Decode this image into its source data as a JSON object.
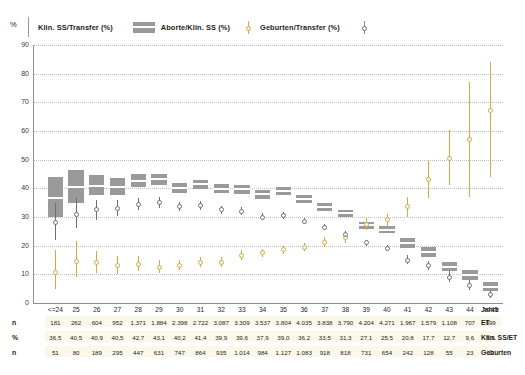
{
  "axis_corner_label": "%",
  "legend": {
    "items": [
      {
        "name": "klin-ss-transfer",
        "label": "Klin. SS/Transfer (%)",
        "marker": "vertical-rule",
        "color": "#999999"
      },
      {
        "name": "aborte-klin-ss",
        "label": "Aborte/Klin. SS (%)",
        "marker": "gray-box",
        "color": "#9a9a9a"
      },
      {
        "name": "geburten-transfer",
        "label": "Geburten/Transfer (%)",
        "marker": "orange-point",
        "color": "#e0a63c"
      },
      {
        "name": "gray-point-series",
        "label": "",
        "marker": "gray-point",
        "color": "#6f6f6f"
      }
    ]
  },
  "table": {
    "row_labels": [
      "n",
      "%",
      "n"
    ],
    "row_names": [
      "Jahre",
      "ET",
      "Klin. SS/ET",
      "Geburten"
    ],
    "et": [
      "181",
      "262",
      "604",
      "952",
      "1.371",
      "1.884",
      "2.398",
      "2.722",
      "3.087",
      "3.309",
      "3.537",
      "3.804",
      "4.035",
      "3.838",
      "3.790",
      "4.204",
      "4.271",
      "1.967",
      "1.579",
      "1.108",
      "707",
      "699"
    ],
    "klin_ss_et": [
      "36,5",
      "40,5",
      "40,9",
      "40,5",
      "42,7",
      "43,1",
      "40,2",
      "41,4",
      "39,9",
      "39,6",
      "37,9",
      "39,0",
      "36,2",
      "33,5",
      "31,3",
      "27,1",
      "25,5",
      "20,8",
      "17,7",
      "12,7",
      "9,6",
      "5,6"
    ],
    "geburten": [
      "51",
      "80",
      "189",
      "295",
      "447",
      "631",
      "747",
      "864",
      "935",
      "1.014",
      "984",
      "1.127",
      "1.083",
      "918",
      "818",
      "731",
      "654",
      "242",
      "128",
      "55",
      "23",
      "12"
    ]
  },
  "chart_data": {
    "type": "scatter",
    "title": "",
    "xlabel": "Jahre",
    "ylabel": "%",
    "ylim": [
      0,
      90
    ],
    "yticks": [
      0,
      10,
      20,
      30,
      40,
      50,
      60,
      70,
      80,
      90
    ],
    "grid": true,
    "legend_position": "top",
    "categories": [
      "<=24",
      "25",
      "26",
      "27",
      "28",
      "29",
      "30",
      "31",
      "32",
      "33",
      "34",
      "35",
      "36",
      "37",
      "38",
      "39",
      "40",
      "41",
      "42",
      "43",
      "44",
      ">=45"
    ],
    "series": [
      {
        "name": "Klin. SS/Transfer (%)",
        "type": "box",
        "color": "#9a9a9a",
        "values": [
          36.5,
          40.5,
          40.9,
          40.5,
          42.7,
          43.1,
          40.2,
          41.4,
          39.9,
          39.6,
          37.9,
          39.0,
          36.2,
          33.5,
          31.3,
          27.1,
          25.5,
          20.8,
          17.7,
          12.7,
          9.6,
          5.6
        ],
        "ci_low": [
          30.0,
          35.0,
          37.5,
          37.8,
          40.4,
          41.2,
          38.5,
          39.9,
          38.4,
          38.1,
          36.4,
          37.6,
          34.9,
          32.2,
          30.0,
          25.9,
          24.3,
          19.1,
          16.0,
          11.2,
          8.0,
          4.3
        ],
        "ci_high": [
          44.0,
          46.5,
          44.5,
          43.5,
          45.1,
          45.1,
          41.9,
          43.0,
          41.4,
          41.1,
          39.4,
          40.5,
          37.6,
          34.9,
          32.6,
          28.4,
          26.8,
          22.7,
          19.5,
          14.4,
          11.4,
          7.3
        ]
      },
      {
        "name": "Aborte/Klin. SS (%)",
        "type": "point-ci",
        "color": "#e0a63c",
        "values": [
          10.5,
          14.5,
          14.0,
          13.0,
          13.5,
          12.5,
          13.0,
          14.0,
          14.0,
          16.5,
          17.5,
          18.5,
          19.5,
          21.0,
          23.0,
          27.5,
          29.0,
          33.5,
          43.0,
          50.5,
          57.0,
          67.0
        ],
        "ci_low": [
          5.0,
          9.0,
          10.5,
          10.0,
          11.0,
          10.5,
          11.5,
          12.5,
          12.5,
          15.0,
          16.0,
          17.0,
          18.0,
          19.5,
          21.0,
          25.5,
          27.0,
          30.0,
          36.5,
          41.0,
          37.0,
          44.0
        ],
        "ci_high": [
          18.5,
          21.5,
          18.0,
          16.5,
          16.5,
          15.0,
          15.0,
          16.0,
          16.0,
          18.5,
          19.0,
          20.0,
          21.0,
          23.0,
          25.0,
          29.5,
          31.0,
          37.0,
          50.0,
          60.5,
          77.0,
          84.0
        ]
      },
      {
        "name": "Geburten/Transfer (%)",
        "type": "point-ci",
        "color": "#6f6f6f",
        "values": [
          28.0,
          31.0,
          32.5,
          33.0,
          34.5,
          35.0,
          33.5,
          34.0,
          32.5,
          32.0,
          30.0,
          30.5,
          28.5,
          26.5,
          24.0,
          21.0,
          19.0,
          15.0,
          13.0,
          9.0,
          6.0,
          3.0
        ],
        "ci_low": [
          22.0,
          26.0,
          29.0,
          30.5,
          32.5,
          33.2,
          32.0,
          32.6,
          31.2,
          30.7,
          28.8,
          29.3,
          27.4,
          25.4,
          22.9,
          19.9,
          18.0,
          13.5,
          11.5,
          7.2,
          4.4,
          1.8
        ],
        "ci_high": [
          35.0,
          36.5,
          36.0,
          36.0,
          36.6,
          36.9,
          35.1,
          35.5,
          33.9,
          33.4,
          31.3,
          31.8,
          29.7,
          27.6,
          25.1,
          22.1,
          20.1,
          16.6,
          14.6,
          11.0,
          7.9,
          4.6
        ]
      }
    ]
  }
}
